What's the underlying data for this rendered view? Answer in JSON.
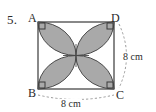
{
  "problem": {
    "number": "5.",
    "figure_type": "square-with-four-petal-shaded-region"
  },
  "vertices": {
    "top_left": "A",
    "top_right": "D",
    "bottom_left": "B",
    "bottom_right": "C"
  },
  "dimensions": {
    "bottom_label": "8 cm",
    "right_label": "8 cm"
  },
  "colors": {
    "petal_fill": "#a9a9a9",
    "outline": "#4a4a4a",
    "square_stroke": "#3a3a3a",
    "dashed_guide": "#9a9a9a",
    "text": "#2b2b2b",
    "background": "#ffffff"
  },
  "geometry": {
    "square": {
      "x": 38,
      "y": 22,
      "width": 76,
      "height": 67
    },
    "right_angle_markers": 4,
    "petals": 4,
    "petal_arc_radius_note": "half of side"
  }
}
